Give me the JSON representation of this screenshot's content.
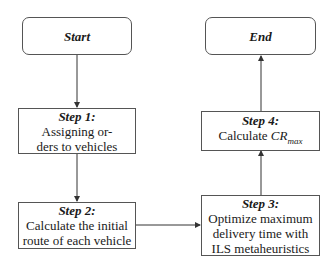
{
  "diagram": {
    "type": "flowchart",
    "nodes": {
      "start": {
        "title": "Start"
      },
      "end": {
        "title": "End"
      },
      "step1": {
        "title": "Step 1:",
        "lines": [
          "Assigning or-",
          "ders to vehicles"
        ]
      },
      "step2": {
        "title": "Step 2:",
        "lines": [
          "Calculate the initial",
          "route of each vehicle"
        ]
      },
      "step3": {
        "title": "Step 3:",
        "lines": [
          "Optimize maximum",
          "delivery time with",
          "ILS metaheuristics"
        ]
      },
      "step4": {
        "title": "Step 4:",
        "line_prefix": "Calculate ",
        "math_base": "CR",
        "math_sub": "max"
      }
    },
    "edges": [
      {
        "from": "start",
        "to": "step1"
      },
      {
        "from": "step1",
        "to": "step2"
      },
      {
        "from": "step2",
        "to": "step3"
      },
      {
        "from": "step3",
        "to": "step4"
      },
      {
        "from": "step4",
        "to": "end"
      }
    ],
    "colors": {
      "stroke": "#555555",
      "text": "#1a1a1a",
      "background": "#ffffff"
    }
  }
}
